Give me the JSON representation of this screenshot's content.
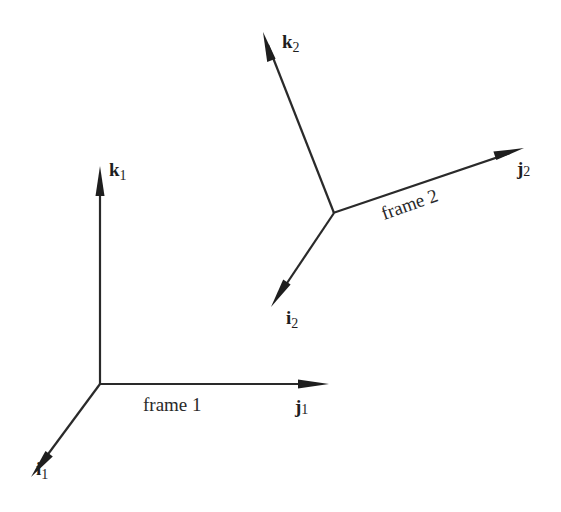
{
  "diagram": {
    "frames": [
      {
        "name": "frame 1",
        "label": "frame 1",
        "origin": [
          100,
          384
        ],
        "axes": {
          "i": {
            "symbol": "i",
            "subscript": "1",
            "tip": [
              32,
              476
            ]
          },
          "j": {
            "symbol": "j",
            "subscript": "1",
            "tip": [
              327,
              384
            ]
          },
          "k": {
            "symbol": "k",
            "subscript": "1",
            "tip": [
              100,
              168
            ]
          }
        }
      },
      {
        "name": "frame 2",
        "label": "frame 2",
        "origin": [
          334,
          213
        ],
        "axes": {
          "i": {
            "symbol": "i",
            "subscript": "2",
            "tip": [
              272,
              306
            ]
          },
          "j": {
            "symbol": "j",
            "subscript": "2",
            "tip": [
              523,
              148
            ]
          },
          "k": {
            "symbol": "k",
            "subscript": "2",
            "tip": [
              263,
              32
            ]
          }
        }
      }
    ],
    "colors": {
      "line": "#2a2a2a",
      "text": "#1e1e1e",
      "background": "#ffffff"
    }
  }
}
